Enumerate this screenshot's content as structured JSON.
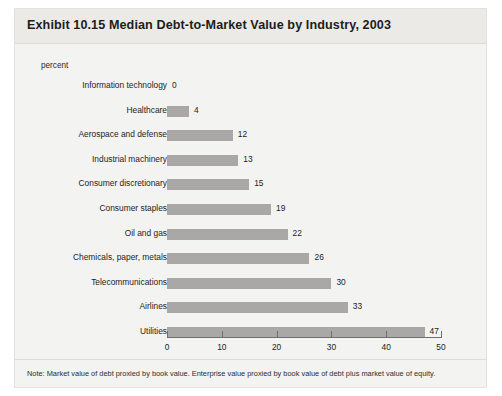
{
  "title": "Exhibit 10.15 Median Debt-to-Market Value by Industry, 2003",
  "axis_unit": "percent",
  "note": "Note: Market value of debt proxied by book value. Enterprise value proxied by book value of debt plus market value of equity.",
  "colors": {
    "bar": "#a9a8a6",
    "card_background": "#f3f3f2",
    "header_band": "#eceae7",
    "text": "#1d1d1b",
    "axis": "#6f6f6d"
  },
  "chart_data": {
    "type": "bar",
    "orientation": "horizontal",
    "title": "Exhibit 10.15 Median Debt-to-Market Value by Industry, 2003",
    "xlabel": "percent",
    "ylabel": "",
    "xlim": [
      0,
      50
    ],
    "xticks": [
      0,
      10,
      20,
      30,
      40,
      50
    ],
    "xtick_labels": [
      "0",
      "10",
      "20",
      "30",
      "40",
      "50"
    ],
    "grid": false,
    "legend": false,
    "data_labels": true,
    "categories": [
      "Information technology",
      "Healthcare",
      "Aerospace and defense",
      "Industrial machinery",
      "Consumer discretionary",
      "Consumer staples",
      "Oil and gas",
      "Chemicals, paper, metals",
      "Telecommunications",
      "Airlines",
      "Utilities"
    ],
    "values": [
      0,
      4,
      12,
      13,
      15,
      19,
      22,
      26,
      30,
      33,
      47
    ],
    "value_labels": [
      "0",
      "4",
      "12",
      "13",
      "15",
      "19",
      "22",
      "26",
      "30",
      "33",
      "47"
    ]
  }
}
